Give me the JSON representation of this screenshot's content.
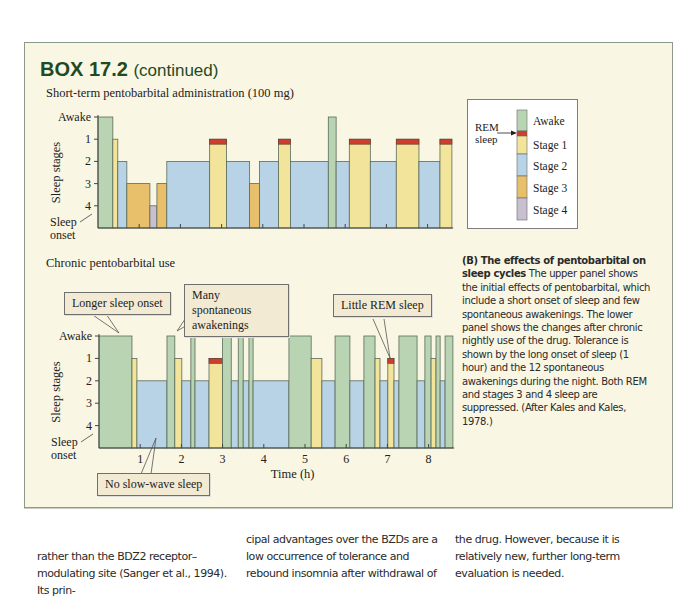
{
  "box": {
    "label": "BOX 17.2",
    "continued": "(continued)"
  },
  "colors": {
    "awake": "#b9d4b2",
    "rem": "#cf3e2c",
    "stage1": "#f2e49a",
    "stage2": "#b9d3e6",
    "stage3": "#e8bf6a",
    "stage4": "#c9c0cf",
    "box_bg": "#f9f6e3",
    "title": "#1e4a24"
  },
  "legend": {
    "rem_label_1": "REM",
    "rem_label_2": "sleep",
    "items": [
      "Awake",
      "Stage 1",
      "Stage 2",
      "Stage 3",
      "Stage 4"
    ]
  },
  "callouts": {
    "longer_onset": "Longer sleep onset",
    "many_awakenings_1": "Many spontaneous",
    "many_awakenings_2": "awakenings",
    "little_rem": "Little REM sleep",
    "no_sws": "No slow-wave sleep"
  },
  "caption": {
    "bold": "(B)  The effects of pentobarbital on sleep cycles",
    "text": " The upper panel shows the initial effects of pentobarbital, which include a short onset of sleep and few spontaneous awakenings. The lower panel shows the changes after chronic nightly use of the drug. Tolerance is shown by the long onset of sleep (1 hour) and the 12 spontaneous awakenings during the night. Both REM and stages 3 and 4 sleep are suppressed. (After Kales and Kales, 1978.)"
  },
  "body_text": {
    "col1": "rather than the BDZ2 receptor–modulating site (Sanger et al., 1994). Its prin-",
    "col2": "cipal advantages over the BZDs are a low occurrence of tolerance and rebound insomnia after withdrawal of",
    "col3": "the drug. However, because it is relatively new, further long-term evaluation is needed."
  },
  "chart_data": [
    {
      "type": "step/bar (hypnogram)",
      "title": "Short-term pentobarbital administration (100 mg)",
      "ylabel": "Sleep stages",
      "yticks": [
        "Awake",
        "1",
        "2",
        "3",
        "4"
      ],
      "y_bottom_label": "Sleep onset",
      "xlabel": "Time (h)",
      "xlim": [
        0,
        8.6
      ],
      "grid": false,
      "segments_hours": [
        {
          "start": 0.0,
          "end": 0.36,
          "stage": "Awake"
        },
        {
          "start": 0.36,
          "end": 0.48,
          "stage": "1"
        },
        {
          "start": 0.48,
          "end": 0.7,
          "stage": "2"
        },
        {
          "start": 0.7,
          "end": 1.26,
          "stage": "3"
        },
        {
          "start": 1.26,
          "end": 1.43,
          "stage": "4"
        },
        {
          "start": 1.43,
          "end": 1.67,
          "stage": "3"
        },
        {
          "start": 1.67,
          "end": 2.71,
          "stage": "2"
        },
        {
          "start": 2.71,
          "end": 3.12,
          "stage": "REM"
        },
        {
          "start": 3.12,
          "end": 3.68,
          "stage": "2"
        },
        {
          "start": 3.68,
          "end": 3.92,
          "stage": "3"
        },
        {
          "start": 3.92,
          "end": 4.38,
          "stage": "2"
        },
        {
          "start": 4.38,
          "end": 4.67,
          "stage": "REM"
        },
        {
          "start": 4.67,
          "end": 5.59,
          "stage": "2"
        },
        {
          "start": 5.59,
          "end": 5.78,
          "stage": "Awake"
        },
        {
          "start": 5.78,
          "end": 6.1,
          "stage": "2"
        },
        {
          "start": 6.1,
          "end": 6.61,
          "stage": "REM"
        },
        {
          "start": 6.61,
          "end": 7.24,
          "stage": "2"
        },
        {
          "start": 7.24,
          "end": 7.79,
          "stage": "REM"
        },
        {
          "start": 7.79,
          "end": 8.3,
          "stage": "2"
        },
        {
          "start": 8.3,
          "end": 8.59,
          "stage": "REM"
        }
      ]
    },
    {
      "type": "step/bar (hypnogram)",
      "title": "Chronic pentobarbital use",
      "ylabel": "Sleep stages",
      "yticks": [
        "Awake",
        "1",
        "2",
        "3",
        "4"
      ],
      "y_bottom_label": "Sleep onset",
      "xlabel": "Time (h)",
      "xticks": [
        "1",
        "2",
        "3",
        "4",
        "5",
        "6",
        "7",
        "8"
      ],
      "xlim": [
        0,
        8.6
      ],
      "grid": false,
      "segments_hours": [
        {
          "start": 0.0,
          "end": 0.8,
          "stage": "Awake"
        },
        {
          "start": 0.8,
          "end": 0.92,
          "stage": "1"
        },
        {
          "start": 0.92,
          "end": 1.65,
          "stage": "2"
        },
        {
          "start": 1.65,
          "end": 1.84,
          "stage": "Awake"
        },
        {
          "start": 1.84,
          "end": 2.01,
          "stage": "1"
        },
        {
          "start": 2.01,
          "end": 2.23,
          "stage": "2"
        },
        {
          "start": 2.23,
          "end": 2.33,
          "stage": "Awake"
        },
        {
          "start": 2.33,
          "end": 2.67,
          "stage": "2"
        },
        {
          "start": 2.67,
          "end": 3.0,
          "stage": "REM"
        },
        {
          "start": 3.0,
          "end": 3.21,
          "stage": "Awake"
        },
        {
          "start": 3.21,
          "end": 3.38,
          "stage": "2"
        },
        {
          "start": 3.38,
          "end": 3.5,
          "stage": "Awake"
        },
        {
          "start": 3.5,
          "end": 3.64,
          "stage": "2"
        },
        {
          "start": 3.64,
          "end": 3.74,
          "stage": "Awake"
        },
        {
          "start": 3.74,
          "end": 4.61,
          "stage": "2"
        },
        {
          "start": 4.61,
          "end": 5.15,
          "stage": "Awake"
        },
        {
          "start": 5.15,
          "end": 5.41,
          "stage": "1"
        },
        {
          "start": 5.41,
          "end": 5.73,
          "stage": "2"
        },
        {
          "start": 5.73,
          "end": 6.09,
          "stage": "Awake"
        },
        {
          "start": 6.09,
          "end": 6.43,
          "stage": "2"
        },
        {
          "start": 6.43,
          "end": 6.7,
          "stage": "Awake"
        },
        {
          "start": 6.7,
          "end": 6.82,
          "stage": "1"
        },
        {
          "start": 6.82,
          "end": 7.01,
          "stage": "2"
        },
        {
          "start": 7.01,
          "end": 7.16,
          "stage": "REM"
        },
        {
          "start": 7.16,
          "end": 7.28,
          "stage": "2"
        },
        {
          "start": 7.28,
          "end": 7.72,
          "stage": "Awake"
        },
        {
          "start": 7.72,
          "end": 7.91,
          "stage": "2"
        },
        {
          "start": 7.91,
          "end": 8.06,
          "stage": "Awake"
        },
        {
          "start": 8.06,
          "end": 8.18,
          "stage": "1"
        },
        {
          "start": 8.18,
          "end": 8.28,
          "stage": "Awake"
        },
        {
          "start": 8.28,
          "end": 8.4,
          "stage": "2"
        },
        {
          "start": 8.4,
          "end": 8.59,
          "stage": "Awake"
        }
      ],
      "annotations": [
        "Longer sleep onset",
        "Many spontaneous awakenings",
        "Little REM sleep",
        "No slow-wave sleep"
      ]
    }
  ]
}
